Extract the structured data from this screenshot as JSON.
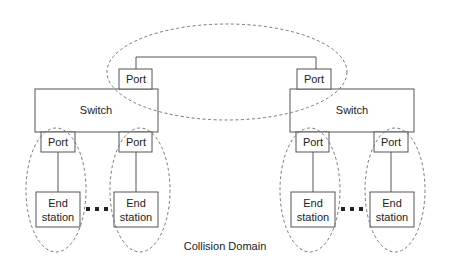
{
  "diagram": {
    "caption": "Collision Domain",
    "colors": {
      "stroke": "#555555",
      "dashed": "#777777",
      "text": "#222222",
      "background": "#ffffff"
    },
    "switches": [
      {
        "label": "Switch",
        "uplink_port": "Port",
        "ports": [
          "Port",
          "Port"
        ],
        "end_stations": [
          [
            "End",
            "station"
          ],
          [
            "End",
            "station"
          ]
        ]
      },
      {
        "label": "Switch",
        "uplink_port": "Port",
        "ports": [
          "Port",
          "Port"
        ],
        "end_stations": [
          [
            "End",
            "station"
          ],
          [
            "End",
            "station"
          ]
        ]
      }
    ],
    "ellipsis": "..."
  }
}
